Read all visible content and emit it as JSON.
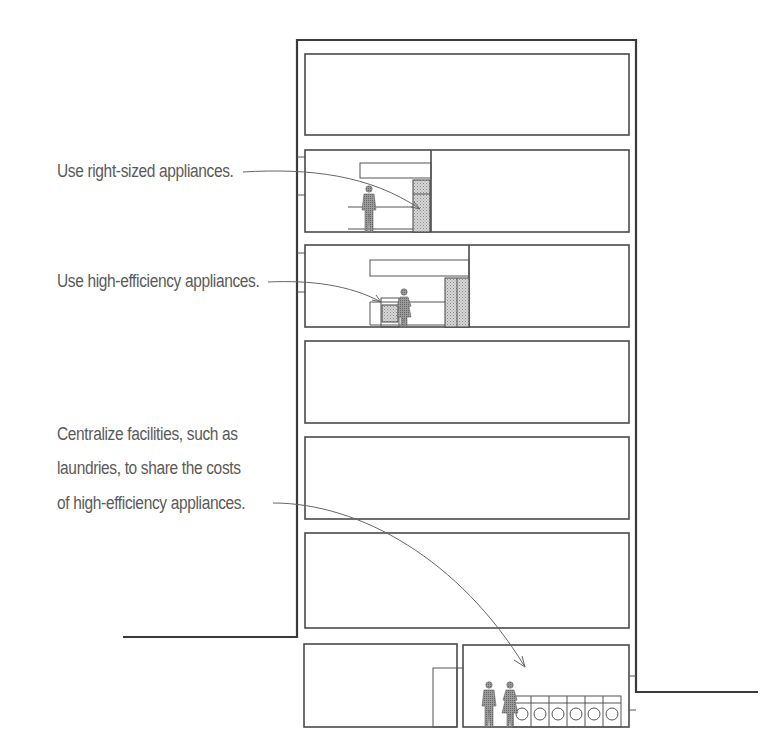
{
  "annotations": [
    {
      "id": "right-sized",
      "lines": [
        "Use right-sized appliances."
      ]
    },
    {
      "id": "high-efficiency",
      "lines": [
        "Use high-efficiency appliances."
      ]
    },
    {
      "id": "centralize",
      "lines": [
        "Centralize facilities, such as",
        "laundries, to share the costs",
        "of high-efficiency appliances."
      ]
    }
  ],
  "building": {
    "floors": 6,
    "basement_rooms": 2,
    "laundry_washers": 6
  },
  "colors": {
    "line": "#3a3a3a",
    "text": "#5a5a5a",
    "fill_pattern": "#8a8a8a"
  }
}
